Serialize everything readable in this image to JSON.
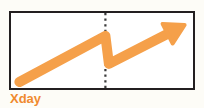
{
  "figure": {
    "x_axis_label": "Xday",
    "label_color": "#f08a2e",
    "frame_border_color": "#231f20",
    "plot_background": "#ffffff",
    "page_background": "#fdfcf7",
    "divider_color": "#3a3a3a",
    "divider_style": "dotted"
  },
  "chart_data": {
    "type": "line",
    "title": "",
    "subtitle": "",
    "xlabel": "Xday",
    "ylabel": "",
    "grid": false,
    "legend": null,
    "series": [
      {
        "name": "trend",
        "color": "#f5a04a",
        "line_width": 10,
        "arrow_end": true,
        "x": [
          0.02,
          0.52,
          0.54,
          0.98
        ],
        "y": [
          0.03,
          0.72,
          0.3,
          0.88
        ]
      }
    ],
    "annotations": [
      {
        "type": "vline",
        "name": "event-divider",
        "x": 0.52,
        "style": "dotted",
        "color": "#3a3a3a"
      }
    ],
    "xlim": [
      0,
      1
    ],
    "ylim": [
      0,
      1
    ]
  }
}
